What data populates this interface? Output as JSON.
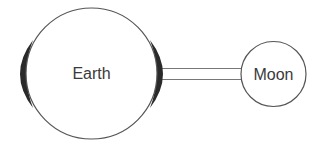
{
  "diagram": {
    "earth": {
      "label": "Earth",
      "stroke": "#555555",
      "fill": "#ffffff"
    },
    "moon": {
      "label": "Moon",
      "stroke": "#555555",
      "fill": "#ffffff"
    },
    "tidal_bulges": {
      "color": "#2a2a2a"
    },
    "connector": {
      "stroke": "#777777"
    }
  }
}
